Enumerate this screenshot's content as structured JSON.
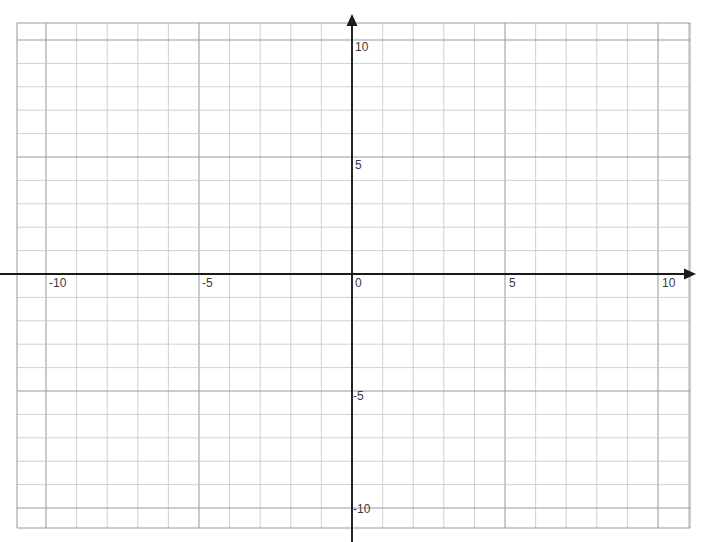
{
  "document": {
    "type": "cartesian-coordinate-grid",
    "background_color": "#ffffff",
    "width": 712,
    "height": 542
  },
  "grid": {
    "minor_line_color": "#c8c8c8",
    "major_line_color": "#9a9a9a",
    "axis_color": "#1a1a1a",
    "left": 17,
    "top": 23,
    "right": 690,
    "bottom": 528,
    "cell_width": 30.6,
    "cell_height": 23.4,
    "columns": 22,
    "rows": 21.6,
    "show_grid": true
  },
  "axes": {
    "origin_x_px": 352,
    "origin_y_px": 274,
    "x_axis": {
      "name": "x-axis",
      "min": -11,
      "max": 11,
      "tick_interval": 1,
      "labeled_ticks": [
        -10,
        -5,
        0,
        5,
        10
      ],
      "arrow": "right"
    },
    "y_axis": {
      "name": "y-axis",
      "min": -10.7,
      "max": 10.7,
      "tick_interval": 1,
      "labeled_ticks": [
        10,
        5,
        -5,
        -10
      ],
      "arrow": "up"
    }
  },
  "labels": {
    "x_neg_ten": "-10",
    "x_neg_five": "-5",
    "origin": "0",
    "x_pos_five": "5",
    "x_pos_ten": "10",
    "y_pos_ten": "10",
    "y_pos_five": "5",
    "y_neg_five": "-5",
    "y_neg_ten": "-10"
  },
  "chart_data": {
    "type": "scatter",
    "title": "",
    "subtitle": "",
    "xlabel": "",
    "ylabel": "",
    "xlim": [
      -11,
      11
    ],
    "ylim": [
      -10.7,
      10.7
    ],
    "xticks": [
      -10,
      -5,
      0,
      5,
      10
    ],
    "yticks": [
      10,
      5,
      -5,
      -10
    ],
    "xtick_labels": [
      "-10",
      "-5",
      "0",
      "5",
      "10"
    ],
    "ytick_labels": [
      "10",
      "5",
      "-5",
      "-10"
    ],
    "grid": true,
    "grid_interval": 1,
    "legend": null,
    "legend_position": "none",
    "series": [],
    "annotations": [],
    "note": "Empty blank Cartesian grid template: no plotted data points, lines, curves or shading are present."
  }
}
